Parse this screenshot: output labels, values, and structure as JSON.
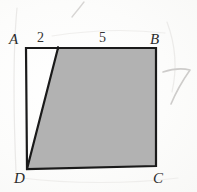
{
  "figure": {
    "vertices": {
      "A": "A",
      "B": "B",
      "C": "C",
      "D": "D"
    },
    "segment_labels": {
      "left_top": "2",
      "right_top": "5"
    },
    "colors": {
      "paper": "#fdfdfc",
      "ink": "#1a1a1a",
      "shading": "#b2b2b2",
      "shading_edge": "#9d9d9d",
      "pencil": "#b9b6b4",
      "label_ink": "#2b2b2b"
    },
    "geometry": {
      "rect_top_left": [
        26,
        48
      ],
      "rect_top_right": [
        156,
        48
      ],
      "rect_bottom_right": [
        156,
        166
      ],
      "rect_bottom_left": [
        27,
        169
      ],
      "slant_top": [
        58,
        48
      ],
      "slant_bottom": [
        27,
        169
      ],
      "shaded_polygon": [
        [
          58,
          48
        ],
        [
          156,
          48
        ],
        [
          156,
          166
        ],
        [
          27,
          169
        ]
      ]
    },
    "annotations": {
      "pencil_stroke_top": "diagonal stroke",
      "pencil_mark_right": "7",
      "pencil_arc_left": "vertical arc",
      "pencil_arc_right": "curved arc"
    }
  }
}
